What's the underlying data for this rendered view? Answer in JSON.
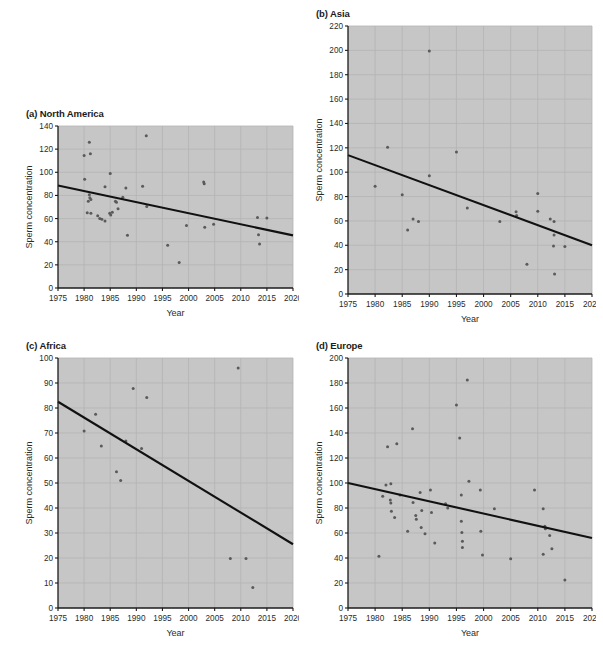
{
  "figure": {
    "background": "#ffffff",
    "plot_background": "#c9c9c9",
    "grid_color": "#b4b4b4",
    "point_color": "#5a5a5a",
    "line_color": "#111111",
    "axis_color": "#1b1b1b"
  },
  "panels": [
    {
      "key": "north_america",
      "title": "(a) North America",
      "x": 14,
      "y": 108,
      "w": 285,
      "h": 222
    },
    {
      "key": "asia",
      "title": "(b) Asia",
      "x": 300,
      "y": 8,
      "w": 296,
      "h": 330
    },
    {
      "key": "africa",
      "title": "(c) Africa",
      "x": 14,
      "y": 340,
      "w": 285,
      "h": 312
    },
    {
      "key": "europe",
      "title": "(d) Europe",
      "x": 300,
      "y": 340,
      "w": 296,
      "h": 312
    }
  ],
  "chart_data": [
    {
      "type": "scatter",
      "key": "north_america",
      "title": "(a) North America",
      "xlabel": "Year",
      "ylabel": "Sperm concentration",
      "xlim": [
        1975,
        2020
      ],
      "ylim": [
        0,
        140
      ],
      "xticks": [
        1975,
        1980,
        1985,
        1990,
        1995,
        2000,
        2005,
        2010,
        2015,
        2020
      ],
      "yticks": [
        0,
        20,
        40,
        60,
        80,
        100,
        120,
        140
      ],
      "grid": true,
      "legend": "none",
      "points": [
        {
          "x": 1980.1,
          "y": 94.0
        },
        {
          "x": 1980.0,
          "y": 114.5
        },
        {
          "x": 1981.0,
          "y": 126.0
        },
        {
          "x": 1981.2,
          "y": 116.0
        },
        {
          "x": 1981.0,
          "y": 80.5
        },
        {
          "x": 1981.1,
          "y": 78.0
        },
        {
          "x": 1980.8,
          "y": 75.0
        },
        {
          "x": 1981.3,
          "y": 76.5
        },
        {
          "x": 1980.6,
          "y": 65.0
        },
        {
          "x": 1981.3,
          "y": 64.5
        },
        {
          "x": 1982.6,
          "y": 62.5
        },
        {
          "x": 1983.0,
          "y": 60.0
        },
        {
          "x": 1983.4,
          "y": 59.5
        },
        {
          "x": 1984.0,
          "y": 58.0
        },
        {
          "x": 1984.0,
          "y": 87.5
        },
        {
          "x": 1985.0,
          "y": 99.0
        },
        {
          "x": 1984.9,
          "y": 64.5
        },
        {
          "x": 1985.1,
          "y": 63.0
        },
        {
          "x": 1985.4,
          "y": 65.5
        },
        {
          "x": 1986.0,
          "y": 75.0
        },
        {
          "x": 1986.2,
          "y": 74.0
        },
        {
          "x": 1986.5,
          "y": 68.5
        },
        {
          "x": 1987.4,
          "y": 78.5
        },
        {
          "x": 1988.0,
          "y": 86.5
        },
        {
          "x": 1988.3,
          "y": 45.5
        },
        {
          "x": 1991.2,
          "y": 88.0
        },
        {
          "x": 1991.9,
          "y": 131.5
        },
        {
          "x": 1992.0,
          "y": 70.5
        },
        {
          "x": 1996.0,
          "y": 37.0
        },
        {
          "x": 1998.2,
          "y": 22.0
        },
        {
          "x": 1999.6,
          "y": 54.0
        },
        {
          "x": 2002.9,
          "y": 91.5
        },
        {
          "x": 2003.0,
          "y": 90.0
        },
        {
          "x": 2003.1,
          "y": 52.5
        },
        {
          "x": 2004.8,
          "y": 55.0
        },
        {
          "x": 2013.2,
          "y": 61.0
        },
        {
          "x": 2013.4,
          "y": 46.0
        },
        {
          "x": 2013.6,
          "y": 38.0
        },
        {
          "x": 2015.0,
          "y": 60.5
        }
      ],
      "trendline": {
        "x1": 1975,
        "y1": 88.5,
        "x2": 2020,
        "y2": 45.5
      }
    },
    {
      "type": "scatter",
      "key": "asia",
      "title": "(b) Asia",
      "xlabel": "Year",
      "ylabel": "Sperm concentration",
      "xlim": [
        1975,
        2020
      ],
      "ylim": [
        0,
        220
      ],
      "xticks": [
        1975,
        1980,
        1985,
        1990,
        1995,
        2000,
        2005,
        2010,
        2015,
        2020
      ],
      "yticks": [
        0,
        20,
        40,
        60,
        80,
        100,
        120,
        140,
        160,
        180,
        200,
        220
      ],
      "grid": true,
      "legend": "none",
      "points": [
        {
          "x": 1980.0,
          "y": 88.5
        },
        {
          "x": 1982.3,
          "y": 120.5
        },
        {
          "x": 1985.0,
          "y": 81.5
        },
        {
          "x": 1986.0,
          "y": 52.5
        },
        {
          "x": 1987.0,
          "y": 61.5
        },
        {
          "x": 1988.0,
          "y": 59.5
        },
        {
          "x": 1990.0,
          "y": 199.5
        },
        {
          "x": 1990.0,
          "y": 97.0
        },
        {
          "x": 1995.0,
          "y": 116.5
        },
        {
          "x": 1997.0,
          "y": 70.5
        },
        {
          "x": 2003.0,
          "y": 59.5
        },
        {
          "x": 2006.0,
          "y": 67.5
        },
        {
          "x": 2006.1,
          "y": 64.5
        },
        {
          "x": 2008.0,
          "y": 24.5
        },
        {
          "x": 2010.0,
          "y": 82.5
        },
        {
          "x": 2010.0,
          "y": 68.0
        },
        {
          "x": 2012.3,
          "y": 61.5
        },
        {
          "x": 2013.0,
          "y": 59.5
        },
        {
          "x": 2013.0,
          "y": 48.5
        },
        {
          "x": 2012.9,
          "y": 39.5
        },
        {
          "x": 2013.1,
          "y": 16.5
        },
        {
          "x": 2015.0,
          "y": 39.0
        }
      ],
      "trendline": {
        "x1": 1975,
        "y1": 114.0,
        "x2": 2020,
        "y2": 40.0
      }
    },
    {
      "type": "scatter",
      "key": "africa",
      "title": "(c) Africa",
      "xlabel": "Year",
      "ylabel": "Sperm concentration",
      "xlim": [
        1975,
        2020
      ],
      "ylim": [
        0,
        100
      ],
      "xticks": [
        1975,
        1980,
        1985,
        1990,
        1995,
        2000,
        2005,
        2010,
        2015,
        2020
      ],
      "yticks": [
        0,
        10,
        20,
        30,
        40,
        50,
        60,
        70,
        80,
        90,
        100
      ],
      "grid": true,
      "legend": "none",
      "points": [
        {
          "x": 1980.0,
          "y": 70.8
        },
        {
          "x": 1982.2,
          "y": 77.5
        },
        {
          "x": 1983.3,
          "y": 64.8
        },
        {
          "x": 1986.2,
          "y": 54.5
        },
        {
          "x": 1987.0,
          "y": 51.0
        },
        {
          "x": 1988.0,
          "y": 66.8
        },
        {
          "x": 1989.4,
          "y": 87.8
        },
        {
          "x": 1991.0,
          "y": 63.8
        },
        {
          "x": 1992.0,
          "y": 84.2
        },
        {
          "x": 2008.0,
          "y": 19.8
        },
        {
          "x": 2009.5,
          "y": 96.0
        },
        {
          "x": 2011.0,
          "y": 19.8
        },
        {
          "x": 2012.3,
          "y": 8.2
        }
      ],
      "trendline": {
        "x1": 1975,
        "y1": 82.5,
        "x2": 2020,
        "y2": 25.5
      }
    },
    {
      "type": "scatter",
      "key": "europe",
      "title": "(d) Europe",
      "xlabel": "Year",
      "ylabel": "Sperm concentration",
      "xlim": [
        1975,
        2020
      ],
      "ylim": [
        0,
        200
      ],
      "xticks": [
        1975,
        1980,
        1985,
        1990,
        1995,
        2000,
        2005,
        2010,
        2015,
        2020
      ],
      "yticks": [
        0,
        20,
        40,
        60,
        80,
        100,
        120,
        140,
        160,
        180,
        200
      ],
      "grid": true,
      "legend": "none",
      "points": [
        {
          "x": 1980.7,
          "y": 41.5
        },
        {
          "x": 1981.4,
          "y": 89.5
        },
        {
          "x": 1982.0,
          "y": 98.5
        },
        {
          "x": 1982.3,
          "y": 129.0
        },
        {
          "x": 1982.9,
          "y": 99.5
        },
        {
          "x": 1982.8,
          "y": 86.5
        },
        {
          "x": 1982.9,
          "y": 84.0
        },
        {
          "x": 1983.0,
          "y": 77.5
        },
        {
          "x": 1983.6,
          "y": 72.5
        },
        {
          "x": 1984.0,
          "y": 131.5
        },
        {
          "x": 1984.6,
          "y": 90.5
        },
        {
          "x": 1986.0,
          "y": 61.5
        },
        {
          "x": 1986.9,
          "y": 143.5
        },
        {
          "x": 1987.0,
          "y": 84.5
        },
        {
          "x": 1987.5,
          "y": 74.0
        },
        {
          "x": 1987.6,
          "y": 71.0
        },
        {
          "x": 1988.3,
          "y": 92.5
        },
        {
          "x": 1988.6,
          "y": 78.0
        },
        {
          "x": 1988.5,
          "y": 64.5
        },
        {
          "x": 1989.2,
          "y": 59.5
        },
        {
          "x": 1990.2,
          "y": 94.5
        },
        {
          "x": 1990.4,
          "y": 76.5
        },
        {
          "x": 1991.0,
          "y": 52.0
        },
        {
          "x": 1993.0,
          "y": 83.5
        },
        {
          "x": 1993.4,
          "y": 80.0
        },
        {
          "x": 1995.0,
          "y": 162.5
        },
        {
          "x": 1995.6,
          "y": 136.0
        },
        {
          "x": 1995.9,
          "y": 90.5
        },
        {
          "x": 1995.9,
          "y": 69.5
        },
        {
          "x": 1996.0,
          "y": 60.5
        },
        {
          "x": 1996.1,
          "y": 53.5
        },
        {
          "x": 1996.1,
          "y": 48.5
        },
        {
          "x": 1997.0,
          "y": 182.5
        },
        {
          "x": 1997.3,
          "y": 101.5
        },
        {
          "x": 1999.4,
          "y": 94.5
        },
        {
          "x": 1999.5,
          "y": 61.5
        },
        {
          "x": 1999.8,
          "y": 42.5
        },
        {
          "x": 2002.0,
          "y": 79.5
        },
        {
          "x": 2005.0,
          "y": 39.5
        },
        {
          "x": 2009.4,
          "y": 94.5
        },
        {
          "x": 2011.0,
          "y": 79.5
        },
        {
          "x": 2011.3,
          "y": 65.5
        },
        {
          "x": 2011.4,
          "y": 63.5
        },
        {
          "x": 2011.0,
          "y": 43.0
        },
        {
          "x": 2012.2,
          "y": 58.0
        },
        {
          "x": 2012.6,
          "y": 47.5
        },
        {
          "x": 2015.0,
          "y": 22.5
        }
      ],
      "trendline": {
        "x1": 1975,
        "y1": 100.0,
        "x2": 2020,
        "y2": 56.0
      }
    }
  ]
}
